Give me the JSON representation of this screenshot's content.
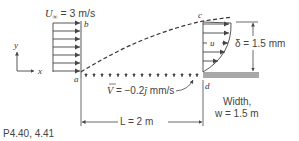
{
  "diagram": {
    "freestream_label": "U∞ = 3 m/s",
    "freestream_symbol": "U",
    "freestream_sub": "∞",
    "freestream_value": " = 3 m/s",
    "point_a": "a",
    "point_b": "b",
    "point_c": "c",
    "point_d": "d",
    "axis_x": "x",
    "axis_y": "y",
    "velocity_profile_label": "u",
    "thickness_label": "δ = 1.5 mm",
    "suction_label_vec": "V",
    "suction_label_value": " = −0.2",
    "suction_label_unit_vec": "ĵ",
    "suction_label_units": " mm/s",
    "length_label": "L = 2 m",
    "width_label_line1": "Width,",
    "width_label_line2": "w = 1.5 m",
    "caption": "P4.40, 4.41"
  },
  "colors": {
    "line": "#444444",
    "wall": "#a8a8a8",
    "text": "#444444"
  }
}
